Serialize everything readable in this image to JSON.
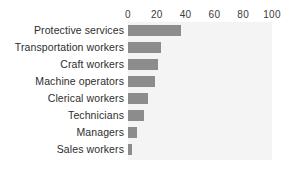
{
  "chart_data": {
    "type": "bar",
    "orientation": "horizontal",
    "title": "",
    "subtitle": "",
    "xlabel": "",
    "ylabel": "",
    "xlim": [
      0,
      100
    ],
    "xticks": [
      0,
      20,
      40,
      60,
      80,
      100
    ],
    "xtick_labels": [
      "0",
      "20",
      "40",
      "60",
      "80",
      "100"
    ],
    "grid": false,
    "legend": null,
    "legend_position": "none",
    "bar_color": "#8c8c8c",
    "plot_background": "#f4f4f4",
    "page_background": "#ffffff",
    "categories": [
      "Protective services",
      "Transportation workers",
      "Craft workers",
      "Machine operators",
      "Clerical workers",
      "Technicians",
      "Managers",
      "Sales workers"
    ],
    "values": [
      37,
      23,
      21,
      19,
      14,
      11,
      6,
      3
    ]
  }
}
